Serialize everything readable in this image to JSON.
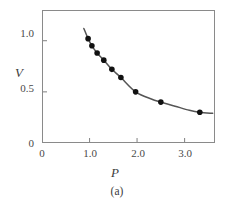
{
  "caption": "(a)",
  "chart_data": {
    "type": "scatter",
    "title": "",
    "subtitle": "",
    "xlabel": "P",
    "ylabel": "V",
    "xlim": [
      0,
      3.64
    ],
    "ylim": [
      0,
      1.3
    ],
    "grid": false,
    "legend": null,
    "xticks": [
      {
        "value": 0,
        "label": "0"
      },
      {
        "value": 1.0,
        "label": "1.0"
      },
      {
        "value": 2.0,
        "label": "2.0"
      },
      {
        "value": 3.0,
        "label": "3.0"
      }
    ],
    "yticks": [
      {
        "value": 0,
        "label": "0"
      },
      {
        "value": 0.5,
        "label": "0.5"
      },
      {
        "value": 1.0,
        "label": "1.0"
      }
    ],
    "series": [
      {
        "name": "measured data",
        "marker": "filled-circle",
        "color": "#111111",
        "x": [
          0.97,
          1.05,
          1.16,
          1.3,
          1.47,
          1.66,
          1.97,
          2.5,
          3.32
        ],
        "y": [
          1.02,
          0.95,
          0.88,
          0.81,
          0.72,
          0.64,
          0.5,
          0.4,
          0.3
        ]
      },
      {
        "name": "fitted curve",
        "marker": "none",
        "color": "#555555",
        "x": [
          0.88,
          0.97,
          1.05,
          1.16,
          1.3,
          1.47,
          1.66,
          1.97,
          2.3,
          2.5,
          2.8,
          3.1,
          3.32,
          3.59
        ],
        "y": [
          1.12,
          1.02,
          0.95,
          0.88,
          0.81,
          0.72,
          0.64,
          0.5,
          0.43,
          0.4,
          0.36,
          0.32,
          0.3,
          0.29
        ]
      }
    ]
  },
  "colors": {
    "frame": "#8a8a8a",
    "curve": "#555555",
    "marker": "#111111",
    "text": "#3c3c3c",
    "background": "#ffffff"
  }
}
